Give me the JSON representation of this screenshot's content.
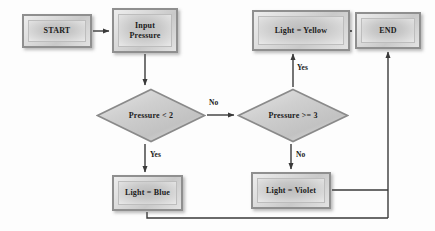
{
  "diagram": {
    "type": "flowchart",
    "colors": {
      "node_fill": "#cfcfcf",
      "node_border": "#8f8f8f",
      "line": "#3a3a3a",
      "text": "#1b1b1b",
      "background": "#fdfdfd"
    },
    "nodes": [
      {
        "id": "start",
        "kind": "terminal",
        "label": "START",
        "x": 22,
        "y": 14,
        "w": 70,
        "h": 34
      },
      {
        "id": "input",
        "kind": "process",
        "label": "Input Pressure",
        "line1": "Input",
        "line2": "Pressure",
        "x": 112,
        "y": 8,
        "w": 66,
        "h": 45
      },
      {
        "id": "decision_lt2",
        "kind": "decision",
        "label": "Pressure < 2",
        "x": 96,
        "y": 88,
        "w": 110,
        "h": 55
      },
      {
        "id": "decision_gte3",
        "kind": "decision",
        "label": "Pressure >= 3",
        "x": 237,
        "y": 88,
        "w": 112,
        "h": 55
      },
      {
        "id": "light_blue",
        "kind": "process",
        "label": "Light = Blue",
        "x": 112,
        "y": 175,
        "w": 71,
        "h": 36
      },
      {
        "id": "light_violet",
        "kind": "process",
        "label": "Light = Violet",
        "x": 251,
        "y": 172,
        "w": 80,
        "h": 37
      },
      {
        "id": "light_yellow",
        "kind": "process",
        "label": "Light = Yellow",
        "x": 252,
        "y": 10,
        "w": 98,
        "h": 41
      },
      {
        "id": "end",
        "kind": "terminal",
        "label": "END",
        "x": 355,
        "y": 12,
        "w": 66,
        "h": 37
      }
    ],
    "edges": [
      {
        "from": "start",
        "to": "input",
        "label": "",
        "arrow": true
      },
      {
        "from": "input",
        "to": "decision_lt2",
        "label": "",
        "arrow": true
      },
      {
        "from": "decision_lt2",
        "to": "light_blue",
        "label": "Yes",
        "arrow": true
      },
      {
        "from": "decision_lt2",
        "to": "decision_gte3",
        "label": "No",
        "arrow": true
      },
      {
        "from": "decision_gte3",
        "to": "light_yellow",
        "label": "Yes",
        "arrow": true
      },
      {
        "from": "decision_gte3",
        "to": "light_violet",
        "label": "No",
        "arrow": true
      },
      {
        "from": "light_yellow",
        "to": "end",
        "label": "",
        "arrow": true
      },
      {
        "from": "light_violet",
        "to": "end",
        "label": "",
        "arrow": true
      },
      {
        "from": "light_blue",
        "to": "end",
        "label": "",
        "arrow": true
      }
    ],
    "edge_labels": {
      "lt2_yes": "Yes",
      "lt2_no": "No",
      "gte3_yes": "Yes",
      "gte3_no": "No"
    }
  }
}
